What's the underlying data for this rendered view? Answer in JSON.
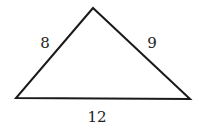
{
  "figure": {
    "type": "triangle",
    "vertices": {
      "top": [
        93,
        8
      ],
      "left": [
        16,
        98
      ],
      "right": [
        190,
        99
      ]
    },
    "sides": [
      {
        "id": "left",
        "label": "8",
        "x": 45,
        "y": 48
      },
      {
        "id": "right",
        "label": "9",
        "x": 152,
        "y": 48
      },
      {
        "id": "base",
        "label": "12",
        "x": 97,
        "y": 122
      }
    ],
    "stroke_color": "#1a1a1a"
  }
}
